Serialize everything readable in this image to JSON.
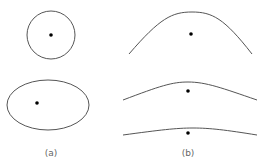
{
  "colors": {
    "stroke": "#555555",
    "dot": "#000000",
    "label": "#666666",
    "background": "#ffffff"
  },
  "panels": [
    {
      "label": "(a)",
      "shapes": [
        {
          "type": "circle",
          "cx": 51,
          "cy": 35,
          "r": 24,
          "dot": [
            51,
            35
          ]
        },
        {
          "type": "ellipse",
          "cx": 48,
          "cy": 105,
          "rx": 41,
          "ry": 25,
          "dot": [
            37,
            103
          ]
        }
      ]
    },
    {
      "label": "(b)",
      "shapes": [
        {
          "type": "bell-curve",
          "from": [
            129,
            54
          ],
          "peak": [
            192,
            12
          ],
          "to": [
            252,
            54
          ],
          "dot": [
            191,
            34
          ]
        },
        {
          "type": "bell-curve",
          "from": [
            123,
            100
          ],
          "peak": [
            188,
            82
          ],
          "to": [
            257,
            100
          ],
          "dot": [
            188,
            91
          ]
        },
        {
          "type": "bell-curve",
          "from": [
            123,
            135
          ],
          "peak": [
            193,
            128
          ],
          "to": [
            257,
            135
          ],
          "dot": [
            188,
            133
          ]
        }
      ]
    }
  ]
}
